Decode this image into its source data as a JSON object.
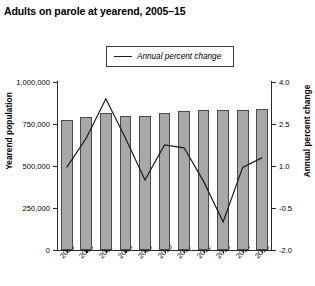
{
  "title": "Adults on parole at yearend, 2005–15",
  "legend": {
    "label": "Annual percent change",
    "line_color": "#1b1b1b"
  },
  "axes": {
    "left_title": "Yearend population",
    "right_title": "Annual percent change",
    "left_ticks": [
      "1,000,000",
      "750,000",
      "500,000",
      "250,000",
      "0"
    ],
    "right_ticks": [
      "4.0",
      "2.5",
      "1.0",
      "-0.5",
      "-2.0"
    ]
  },
  "chart_data": {
    "type": "bar",
    "title": "Adults on parole at yearend, 2005–15",
    "xlabel": "",
    "ylabel": "Yearend population",
    "y2label": "Annual percent change",
    "grid": false,
    "legend_position": "top-center",
    "categories": [
      "2005",
      "2006",
      "2007",
      "2008",
      "2009",
      "2010",
      "2011",
      "2012",
      "2013",
      "2014",
      "2015"
    ],
    "ylim": [
      0,
      1000000
    ],
    "y2lim": [
      -2.0,
      4.0
    ],
    "yticks": [
      0,
      250000,
      500000,
      750000,
      1000000
    ],
    "y2ticks": [
      -2.0,
      -0.5,
      1.0,
      2.5,
      4.0
    ],
    "series": [
      {
        "name": "Yearend population",
        "type": "bar",
        "axis": "left",
        "color": "#a8a8a8",
        "values": [
          775000,
          790000,
          815000,
          800000,
          800000,
          815000,
          827000,
          835000,
          835000,
          835000,
          840000
        ]
      },
      {
        "name": "Annual percent change",
        "type": "line",
        "axis": "right",
        "color": "#1b1b1b",
        "values": [
          0.95,
          2.0,
          3.4,
          2.0,
          0.5,
          1.75,
          1.65,
          0.45,
          -1.0,
          0.95,
          1.3
        ]
      }
    ]
  }
}
